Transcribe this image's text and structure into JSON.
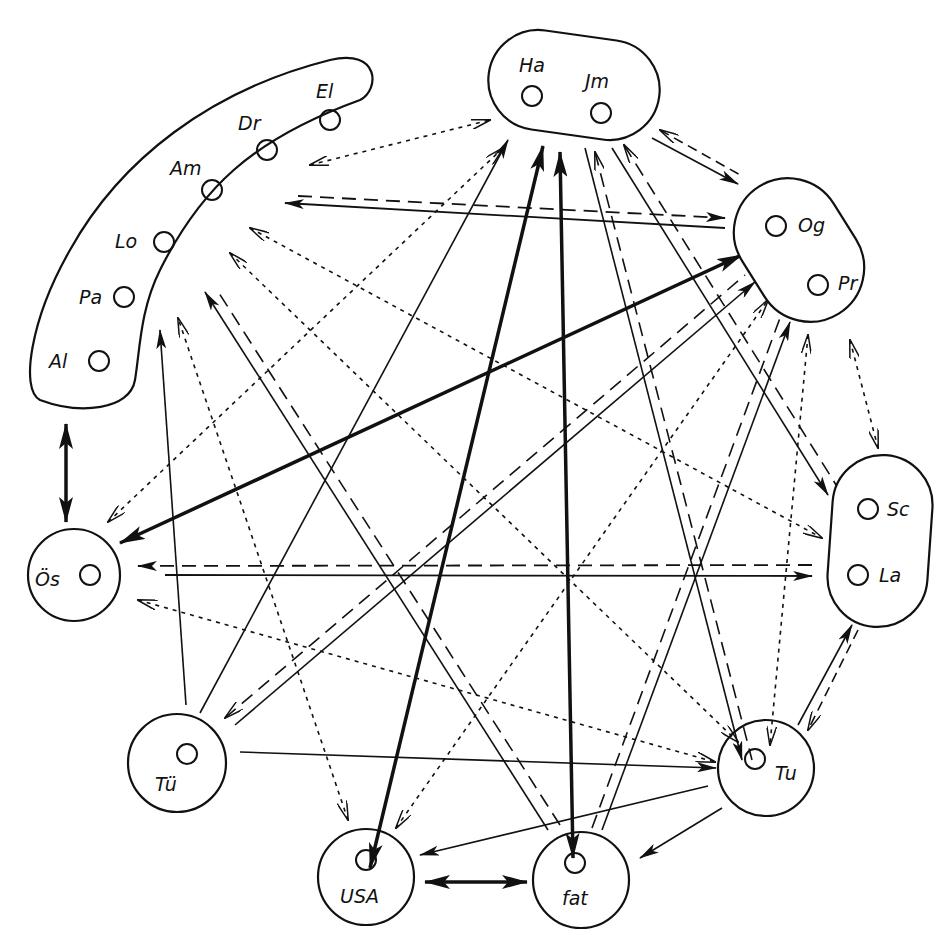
{
  "diagram": {
    "type": "directed relationship network diagram",
    "groups": [
      {
        "id": "west",
        "members": [
          "El",
          "Dr",
          "Am",
          "Lo",
          "Pa",
          "Al"
        ]
      },
      {
        "id": "north",
        "members": [
          "Ha",
          "Jm"
        ]
      },
      {
        "id": "northeast",
        "members": [
          "Og",
          "Pr"
        ]
      },
      {
        "id": "east",
        "members": [
          "Sc",
          "La"
        ]
      },
      {
        "id": "Ös",
        "members": [
          "Ös"
        ]
      },
      {
        "id": "Tü",
        "members": [
          "Tü"
        ]
      },
      {
        "id": "USA",
        "members": [
          "USA"
        ]
      },
      {
        "id": "fat",
        "members": [
          "fat"
        ]
      },
      {
        "id": "Tu",
        "members": [
          "Tu"
        ]
      }
    ],
    "labels": {
      "El": "El",
      "Dr": "Dr",
      "Am": "Am",
      "Lo": "Lo",
      "Pa": "Pa",
      "Al": "Al",
      "Ha": "Ha",
      "Jm": "Jm",
      "Og": "Og",
      "Pr": "Pr",
      "Sc": "Sc",
      "La": "La",
      "Os": "Ös",
      "Tu_ue": "Tü",
      "USA": "USA",
      "fat": "fat",
      "Tu": "Tu"
    },
    "line_styles": [
      "thick solid",
      "thin solid",
      "long dashed",
      "dotted"
    ],
    "edges": [
      {
        "from": "west",
        "to": "Ös",
        "style": "thick",
        "bidirectional": true
      },
      {
        "from": "USA",
        "to": "fat",
        "style": "thick",
        "bidirectional": true
      },
      {
        "from": "Ös",
        "to": "northeast",
        "style": "thick",
        "bidirectional": true
      },
      {
        "from": "north",
        "to": "USA",
        "style": "thick",
        "bidirectional": true
      },
      {
        "from": "north",
        "to": "fat",
        "style": "thick",
        "bidirectional": true
      },
      {
        "from": "northeast",
        "to": "west",
        "style": "solid+dashed",
        "bidirectional": true
      },
      {
        "from": "east",
        "to": "Ös",
        "style": "solid+dashed",
        "bidirectional": true
      },
      {
        "from": "Tü",
        "to": "north",
        "style": "thin",
        "bidirectional": false
      },
      {
        "from": "Tü",
        "to": "west",
        "style": "thin",
        "bidirectional": false
      },
      {
        "from": "Tü",
        "to": "Tu",
        "style": "thin",
        "bidirectional": false
      },
      {
        "from": "Tu",
        "to": "USA",
        "style": "thin",
        "bidirectional": false
      },
      {
        "from": "Tu",
        "to": "fat",
        "style": "thin",
        "bidirectional": false
      },
      {
        "from": "fat",
        "to": "west",
        "style": "solid+dashed",
        "bidirectional": false
      },
      {
        "from": "north",
        "to": "Tu",
        "style": "solid+dashed",
        "bidirectional": true
      },
      {
        "from": "north",
        "to": "east",
        "style": "solid+dashed",
        "bidirectional": true
      },
      {
        "from": "north",
        "to": "northeast",
        "style": "solid+dashed",
        "bidirectional": true
      },
      {
        "from": "Tü",
        "to": "northeast",
        "style": "solid+dashed",
        "bidirectional": true
      },
      {
        "from": "fat",
        "to": "northeast",
        "style": "solid+dashed",
        "bidirectional": false
      },
      {
        "from": "east",
        "to": "Tu",
        "style": "solid+dashed",
        "bidirectional": true
      },
      {
        "from": "west",
        "to": "north",
        "style": "dotted",
        "bidirectional": true
      },
      {
        "from": "Ös",
        "to": "north",
        "style": "dotted",
        "bidirectional": true
      },
      {
        "from": "Ös",
        "to": "Tu",
        "style": "dotted",
        "bidirectional": true
      },
      {
        "from": "USA",
        "to": "west",
        "style": "dotted",
        "bidirectional": true
      },
      {
        "from": "USA",
        "to": "northeast",
        "style": "dotted",
        "bidirectional": true
      },
      {
        "from": "west",
        "to": "east",
        "style": "dotted",
        "bidirectional": true
      },
      {
        "from": "west",
        "to": "Tu",
        "style": "dotted",
        "bidirectional": true
      },
      {
        "from": "northeast",
        "to": "east",
        "style": "dotted",
        "bidirectional": true
      },
      {
        "from": "northeast",
        "to": "Tu",
        "style": "dotted",
        "bidirectional": true
      }
    ]
  }
}
